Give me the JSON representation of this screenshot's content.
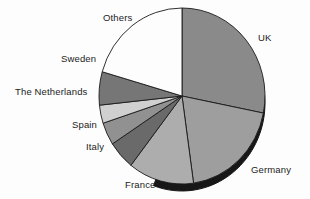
{
  "chart_data": {
    "type": "pie",
    "title": "",
    "subtitle": "",
    "xlabel": "",
    "ylabel": "",
    "legend_position": "none",
    "labels_position": "outside-leader",
    "grid": false,
    "style": "3d-shadow-grayscale",
    "start_angle_deg": 0,
    "direction": "clockwise",
    "categories": [
      "UK",
      "Germany",
      "France",
      "Italy",
      "Spain",
      "The Netherlands",
      "Sweden",
      "Others"
    ],
    "values": [
      28.1,
      19.7,
      12.8,
      5.3,
      4.2,
      3.3,
      6.1,
      20.5
    ],
    "unit": "percent",
    "slices": [
      {
        "label": "UK",
        "value": 28.1,
        "start_deg": 0,
        "end_deg": 101.2,
        "color": "#8a8a8a"
      },
      {
        "label": "Germany",
        "value": 19.7,
        "start_deg": 101.2,
        "end_deg": 172.0,
        "color": "#9e9e9e"
      },
      {
        "label": "France",
        "value": 12.8,
        "start_deg": 172.0,
        "end_deg": 218.0,
        "color": "#adadad"
      },
      {
        "label": "Italy",
        "value": 5.3,
        "start_deg": 218.0,
        "end_deg": 237.0,
        "color": "#6a6a6a"
      },
      {
        "label": "Spain",
        "value": 4.2,
        "start_deg": 237.0,
        "end_deg": 252.0,
        "color": "#919191"
      },
      {
        "label": "The Netherlands",
        "value": 3.3,
        "start_deg": 252.0,
        "end_deg": 264.0,
        "color": "#d0d0d0"
      },
      {
        "label": "Sweden",
        "value": 6.1,
        "start_deg": 264.0,
        "end_deg": 286.0,
        "color": "#767676"
      },
      {
        "label": "Others",
        "value": 20.5,
        "start_deg": 286.0,
        "end_deg": 360.0,
        "color": "#fdfdfd"
      }
    ],
    "colors": [
      "#8a8a8a",
      "#9e9e9e",
      "#adadad",
      "#6a6a6a",
      "#919191",
      "#d0d0d0",
      "#767676",
      "#fdfdfd"
    ],
    "shadow_color": "#171717",
    "outline_color": "#1a1a1a",
    "background_color": "#fdfdfd",
    "geometry": {
      "cx": 182,
      "cy": 96,
      "rx": 83,
      "ry": 88,
      "depth": 7
    }
  },
  "labels": {
    "uk": "UK",
    "germany": "Germany",
    "france": "France",
    "italy": "Italy",
    "spain": "Spain",
    "netherlands": "The Netherlands",
    "sweden": "Sweden",
    "others": "Others"
  }
}
